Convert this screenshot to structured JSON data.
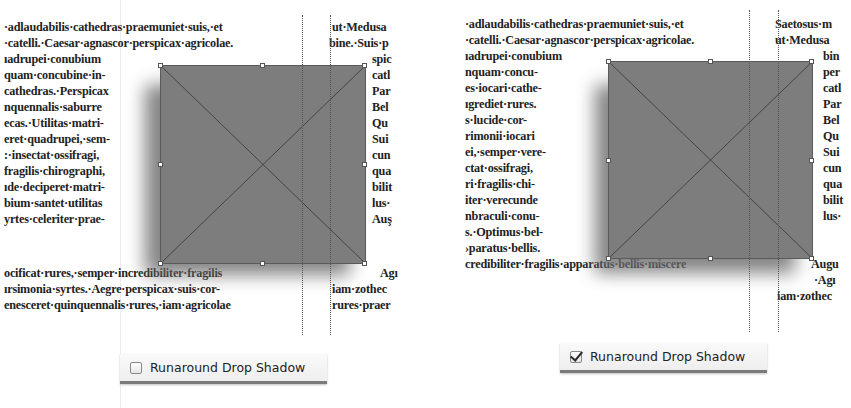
{
  "left_panel": {
    "caption": "Runaround Drop Shadow",
    "checked": false,
    "main_column_lines": [
      "·adlaudabilis·cathedras·praemuniet·suis,·et",
      "·catelli.·Caesar·agnascor·perspicax·agricolae.",
      "ıadrupei·conubium",
      "quam·concubine·in-",
      "cathedras.·Perspicax",
      "nquennalis·saburre",
      "ecas.·Utilitas·matri-",
      "eret·quadrupei,·sem-",
      ":·insectat·ossifragi,",
      "fragilis·chirographi,",
      "ıde·deciperet·matri-",
      "bium·santet·utilitas",
      "yrtes·celeriter·prae-",
      "ocificat·rures,·semper·incredibiliter·fragilis",
      "ırsimonia·syrtes.·Aegre·perspicax·suis·cor-",
      "enesceret·quinquennalis·rures,·iam·agricolae"
    ],
    "side_column_lines": [
      "ut·Medusa",
      "bine.·Suis·p",
      "spic",
      "catl",
      "Par",
      "Bel",
      "Qu",
      "Sui",
      "cun",
      "qua",
      "bilit",
      "lus·",
      "Auş",
      "Agı",
      "iam·zothec",
      "rures·praer"
    ]
  },
  "right_panel": {
    "caption": "Runaround Drop Shadow",
    "checked": true,
    "main_column_lines": [
      "·adlaudabilis·cathedras·praemuniet·suis,·et",
      "·catelli.·Caesar·agnascor·perspicax·agricolae.",
      "ıadrupei·conubium",
      "nquam·concu-",
      "es·iocari·cathe-",
      "ıgrediet·rures.",
      "s·lucide·cor-",
      "rimonii·iocari",
      "ei,·semper·vere-",
      "ctat·ossifragi,",
      "ri·fragilis·chi-",
      "iter·verecunde",
      "nbraculi·conu-",
      "s.·Optimus·bel-",
      "›paratus·bellis.",
      "credibiliter·fragilis·apparatus·bellis·miscere"
    ],
    "side_column_lines": [
      "Saetosus·m",
      "ut·Medusa",
      "bin",
      "per",
      "catl",
      "Par",
      "Bel",
      "Qu",
      "Sui",
      "cun",
      "qua",
      "bilit",
      "lus·",
      "Augu",
      "·Agı",
      "iam·zothec"
    ]
  },
  "colors": {
    "frame_fill": "#7d7d7d",
    "frame_stroke": "#5a5a5a",
    "shadow": "#6e6e6e",
    "text": "#222222"
  }
}
